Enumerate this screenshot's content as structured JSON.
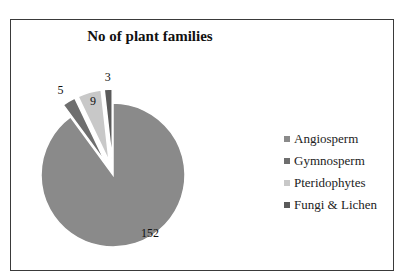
{
  "chart_data": {
    "type": "pie",
    "title": "No of plant families",
    "categories": [
      "Angiosperm",
      "Gymnosperm",
      "Pteridophytes",
      "Fungi & Lichen"
    ],
    "values": [
      152,
      5,
      9,
      3
    ],
    "colors": [
      "#8a8a8a",
      "#6e6e6e",
      "#c8c8c8",
      "#5a5a5a"
    ],
    "data_labels": [
      "152",
      "5",
      "9",
      "3"
    ],
    "exploded": [
      "Gymnosperm",
      "Pteridophytes",
      "Fungi & Lichen"
    ],
    "legend_position": "right"
  },
  "legend": {
    "items": [
      {
        "label": "Angiosperm",
        "color": "#8a8a8a"
      },
      {
        "label": "Gymnosperm",
        "color": "#6e6e6e"
      },
      {
        "label": "Pteridophytes",
        "color": "#c8c8c8"
      },
      {
        "label": "Fungi & Lichen",
        "color": "#5a5a5a"
      }
    ]
  }
}
